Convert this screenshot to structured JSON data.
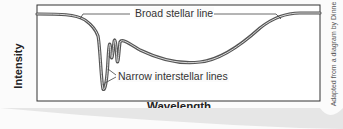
{
  "diagram": {
    "y_axis_label": "Intensity",
    "x_axis_label": "Wavelength",
    "annotations": {
      "broad": "Broad stellar line",
      "narrow": "Narrow interstellar lines"
    },
    "credit": "Adapted from a diagram by Dinne"
  }
}
